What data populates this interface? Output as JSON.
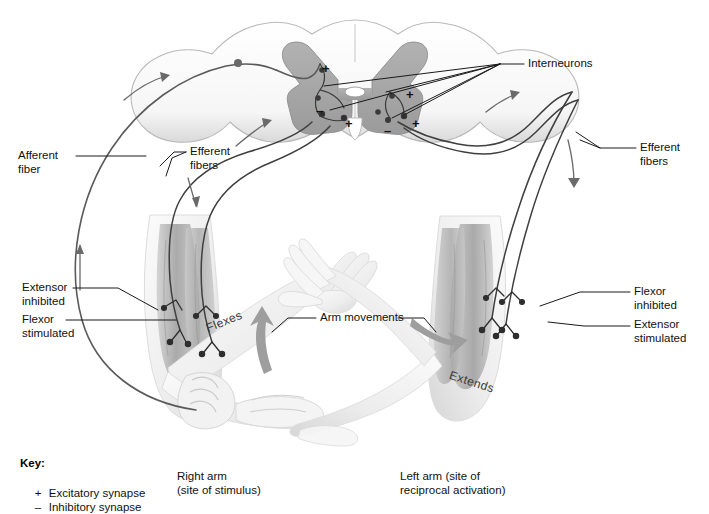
{
  "figure": {
    "type": "anatomical-diagram"
  },
  "colors": {
    "gray_matter": "#a8a8a8",
    "white_matter": "#f2f2f2",
    "outline": "#8d8d8d",
    "nerve": "#4a4a4a",
    "leader": "#1a1a1a",
    "skin_light": "#f4f4f4",
    "skin_shade": "#d9d9d9",
    "muscle": "#b4b4b4",
    "arrow": "#9a9a9a",
    "text": "#111111"
  },
  "labels": {
    "interneurons": "Interneurons",
    "afferent_fiber": "Afferent\nfiber",
    "efferent_fibers_left": "Efferent\nfibers",
    "efferent_fibers_right": "Efferent\nfibers",
    "extensor_inhibited": "Extensor\ninhibited",
    "flexor_stimulated": "Flexor\nstimulated",
    "flexor_inhibited": "Flexor\ninhibited",
    "extensor_stimulated": "Extensor\nstimulated",
    "arm_movements": "Arm movements",
    "flexes": "Flexes",
    "extends": "Extends"
  },
  "captions": {
    "right_arm_line1": "Right arm",
    "right_arm_line2": "(site of stimulus)",
    "left_arm_line1": "Left arm (site of",
    "left_arm_line2": "reciprocal activation)"
  },
  "key": {
    "title": "Key:",
    "items": [
      {
        "symbol": "+",
        "label": "Excitatory synapse"
      },
      {
        "symbol": "–",
        "label": "Inhibitory synapse"
      }
    ]
  },
  "synapse_signs": [
    {
      "id": "left-dorsal-plus",
      "sign": "+",
      "x": 322,
      "y": 62
    },
    {
      "id": "left-minus",
      "sign": "–",
      "x": 318,
      "y": 104
    },
    {
      "id": "left-ventral-plus",
      "sign": "+",
      "x": 345,
      "y": 117
    },
    {
      "id": "right-plus-upper",
      "sign": "+",
      "x": 406,
      "y": 90
    },
    {
      "id": "right-ventral-plus",
      "sign": "+",
      "x": 412,
      "y": 117
    },
    {
      "id": "right-minus",
      "sign": "–",
      "x": 386,
      "y": 124
    }
  ],
  "icons": {
    "ganglion": "dorsal-root-ganglion-icon",
    "flex_arrow": "curved-up-arrow-icon",
    "extend_arrow": "curved-down-arrow-icon"
  }
}
